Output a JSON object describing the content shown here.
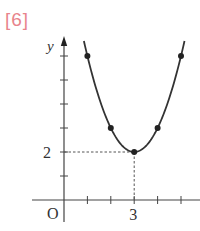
{
  "problem_label": "[6]",
  "colors": {
    "label": "#e8848c",
    "ink": "#333333"
  },
  "chart_data": {
    "type": "line",
    "title": "",
    "function": "y = (x - 3)^2 + 2",
    "xlabel": "",
    "ylabel": "y",
    "origin_label": "O",
    "x_tick_labels": [
      {
        "x": 3,
        "label": "3"
      }
    ],
    "y_tick_labels": [
      {
        "y": 2,
        "label": "2"
      }
    ],
    "x_ticks": [
      1,
      2,
      3,
      4,
      5
    ],
    "y_ticks": [
      1,
      2,
      3,
      4,
      5,
      6
    ],
    "xlim": [
      -1.4,
      5.8
    ],
    "ylim": [
      -0.9,
      6.8
    ],
    "grid": false,
    "legend": null,
    "points": [
      {
        "x": 1,
        "y": 6
      },
      {
        "x": 2,
        "y": 3
      },
      {
        "x": 3,
        "y": 2
      },
      {
        "x": 4,
        "y": 3
      },
      {
        "x": 5,
        "y": 6
      }
    ],
    "vertex": {
      "x": 3,
      "y": 2
    },
    "guides": [
      {
        "type": "dashed",
        "from": {
          "x": 0,
          "y": 2
        },
        "to": {
          "x": 3,
          "y": 2
        }
      },
      {
        "type": "dashed",
        "from": {
          "x": 3,
          "y": 2
        },
        "to": {
          "x": 3,
          "y": 0
        }
      }
    ]
  }
}
